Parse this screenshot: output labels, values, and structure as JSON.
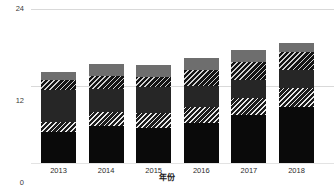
{
  "chart_data": {
    "type": "bar",
    "title": "",
    "subtitle": "",
    "xlabel": "年份",
    "ylabel": "",
    "stacked": true,
    "grid": true,
    "legend": "none",
    "categories": [
      "2013",
      "2014",
      "2015",
      "2016",
      "2017",
      "2018"
    ],
    "ylim": [
      0,
      24
    ],
    "yticks": [
      0,
      12,
      24
    ],
    "ytick_labels": [
      "0",
      "12",
      "24"
    ],
    "series": [
      {
        "name": "segment-1-solid-black",
        "fill": "solid-black",
        "color": "#0a0a0a",
        "values": [
          4.8,
          5.8,
          5.5,
          6.2,
          7.5,
          8.7
        ]
      },
      {
        "name": "segment-2-hatch-light",
        "fill": "hatch-light",
        "color": "#1c1c1c",
        "values": [
          1.6,
          2.2,
          2.3,
          2.5,
          2.6,
          3.0
        ]
      },
      {
        "name": "segment-3-solid-dark",
        "fill": "solid-dark",
        "color": "#262626",
        "values": [
          5.0,
          3.6,
          4.0,
          3.3,
          2.8,
          2.8
        ]
      },
      {
        "name": "segment-4-hatch-dark",
        "fill": "hatch-dark",
        "color": "#141414",
        "values": [
          1.6,
          2.0,
          1.6,
          2.5,
          2.8,
          2.8
        ]
      },
      {
        "name": "segment-5-solid-gray",
        "fill": "solid-gray",
        "color": "#6e6e6e",
        "values": [
          1.2,
          1.9,
          1.9,
          1.9,
          1.9,
          1.4
        ]
      }
    ],
    "totals": [
      14.2,
      15.5,
      15.3,
      16.4,
      17.6,
      18.7
    ]
  },
  "axis": {
    "y_top_label": "24",
    "y_mid_label": "12",
    "y_zero_label": "0"
  }
}
